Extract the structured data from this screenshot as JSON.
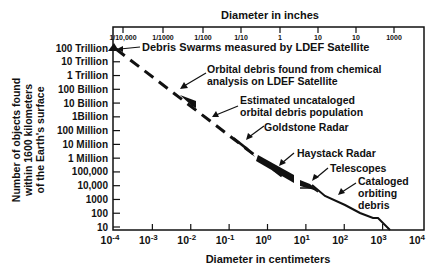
{
  "chart_data": {
    "type": "line",
    "title": "",
    "top_axis_label": "Diameter in inches",
    "top_ticks": [
      "1/10,000",
      "1/1000",
      "1/100",
      "1/10",
      "1",
      "10",
      "10",
      "1000"
    ],
    "xlabel": "Diameter in centimeters",
    "x_scale": "log",
    "xlim": [
      0.0001,
      10000
    ],
    "x_ticks": [
      "10-4",
      "10-3",
      "10-2",
      "10-1",
      "100",
      "101",
      "102",
      "103",
      "104"
    ],
    "x_ticks_base": [
      "10",
      "10",
      "10",
      "10",
      "10",
      "10",
      "10",
      "10",
      "10"
    ],
    "x_ticks_exp": [
      "-4",
      "-3",
      "-2",
      "-1",
      "0",
      "1",
      "2",
      "3",
      "4"
    ],
    "ylabel": [
      "Number of objects found",
      "within 1600 kilometers",
      "of the Earth's surface"
    ],
    "y_scale": "log",
    "ylim": [
      10,
      100000000000000
    ],
    "y_ticks": [
      "100 Trillion",
      "10 Trillion",
      "1 Trillion",
      "100 Billion",
      "10 Billion",
      "1Billion",
      "100  Million",
      "10  Million",
      "1  Million",
      "100,000",
      "10,000",
      "1000",
      "100",
      "10"
    ],
    "grid": false,
    "legend": "none",
    "series": [
      {
        "name": "Estimated uncataloged orbital debris population",
        "style": "dashed",
        "x": [
          0.0001,
          0.001,
          0.01,
          0.1,
          1,
          3
        ],
        "y": [
          100000000000000,
          5000000000000,
          200000000000,
          5000000000,
          100000000,
          20000000
        ]
      },
      {
        "name": "Debris Swarms measured by LDEF Satellite",
        "style": "marker",
        "x": [
          0.0001
        ],
        "y": [
          100000000000000
        ]
      },
      {
        "name": "Orbital debris found from chemical analysis on LDEF Satellite",
        "style": "band",
        "x": [
          0.005,
          0.03
        ],
        "y": [
          500000000000,
          20000000000
        ]
      },
      {
        "name": "Goldstone Radar",
        "style": "band",
        "x": [
          0.15,
          0.6
        ],
        "y": [
          1000000000,
          60000000
        ]
      },
      {
        "name": "Haystack Radar",
        "style": "band",
        "x": [
          0.8,
          5
        ],
        "y": [
          40000000,
          600000
        ]
      },
      {
        "name": "Telescopes",
        "style": "band",
        "x": [
          10,
          25
        ],
        "y": [
          300000,
          60000
        ]
      },
      {
        "name": "Cataloged orbiting debris",
        "style": "solid",
        "x": [
          10,
          30,
          100,
          200,
          700
        ],
        "y": [
          80000,
          15000,
          1500,
          600,
          10
        ]
      }
    ],
    "annotations": [
      "Debris Swarms measured by LDEF Satellite",
      "Orbital debris found from chemical analysis on LDEF Satellite",
      "Estimated uncataloged orbital debris population",
      "Goldstone Radar",
      "Haystack Radar",
      "Telescopes",
      "Cataloged orbiting debris"
    ]
  },
  "labels": {
    "top_axis": "Diameter in inches",
    "bottom_axis": "Diameter in centimeters",
    "y_axis_line1": "Number of objects found",
    "y_axis_line2": "within 1600 kilometers",
    "y_axis_line3": "of the Earth's surface",
    "ann_ldef_swarms": "Debris Swarms measured by LDEF Satellite",
    "ann_chem_line1": "Orbital debris found from chemical",
    "ann_chem_line2": "analysis on LDEF Satellite",
    "ann_est_line1": "Estimated uncataloged",
    "ann_est_line2": "orbital debris population",
    "ann_goldstone": "Goldstone Radar",
    "ann_haystack": "Haystack Radar",
    "ann_telescopes": "Telescopes",
    "ann_cat_line1": "Cataloged",
    "ann_cat_line2": "orbiting",
    "ann_cat_line3": "debris"
  }
}
